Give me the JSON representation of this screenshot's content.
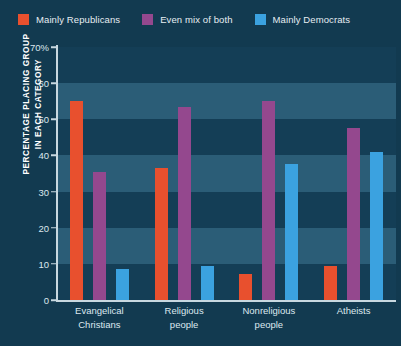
{
  "chart_data": {
    "type": "bar",
    "title": "",
    "subtitle": "",
    "xlabel": "",
    "ylabel": "PERCENTAGE PLACING GROUP IN EACH CATEGORY",
    "ylabel_lines": [
      "PERCENTAGE PLACING GROUP",
      "IN EACH CATEGORY"
    ],
    "ylim": [
      0,
      70
    ],
    "ytick_values": [
      0,
      10,
      20,
      30,
      40,
      50,
      60,
      70
    ],
    "ytick_labels": [
      "0",
      "10",
      "20",
      "30",
      "40",
      "50",
      "60",
      "70%"
    ],
    "grid": "horizontal-bands",
    "legend_position": "top-left",
    "categories": [
      "Evangelical Christians",
      "Religious people",
      "Nonreligious people",
      "Atheists"
    ],
    "category_lines": [
      [
        "Evangelical",
        "Christians"
      ],
      [
        "Religious",
        "people"
      ],
      [
        "Nonreligious",
        "people"
      ],
      [
        "Atheists"
      ]
    ],
    "series": [
      {
        "name": "Mainly Republicans",
        "color": "#E8502E",
        "values": [
          55,
          36.5,
          7.2,
          9.4
        ]
      },
      {
        "name": "Even mix of both",
        "color": "#94488E",
        "values": [
          35.5,
          53.5,
          55,
          47.5
        ]
      },
      {
        "name": "Mainly Democrats",
        "color": "#3BA2E0",
        "values": [
          8.5,
          9.4,
          37.5,
          41
        ]
      }
    ]
  },
  "colors": {
    "background": "#123A50",
    "plot_background": "#143E56",
    "band": "#2B5D77",
    "axis": "#C8D8E0",
    "text": "#DDE8EF",
    "republican": "#E8502E",
    "mixed": "#94488E",
    "democrat": "#3BA2E0"
  }
}
